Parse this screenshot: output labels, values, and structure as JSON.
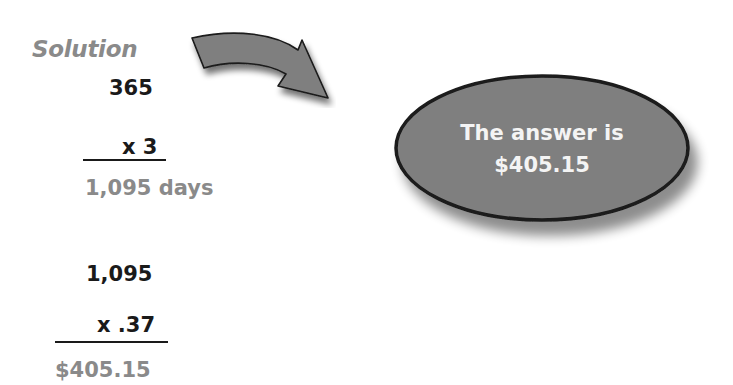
{
  "heading": "Solution",
  "step1": {
    "multiplicand": "365",
    "multiplier": "x 3",
    "result": "1,095 days"
  },
  "step2": {
    "multiplicand": "1,095",
    "multiplier": "x .37",
    "result": "$405.15"
  },
  "callout": {
    "line1": "The answer is",
    "line2": "$405.15"
  },
  "icons": {
    "arrow": "curved-arrow-right",
    "bubble": "oval-callout"
  },
  "colors": {
    "shape_fill": "#7f7f7f",
    "shape_stroke": "#1a1a1a",
    "label_grey": "#8a8a8a",
    "text_dark": "#1a1a1a",
    "callout_text": "#f4f4f4"
  }
}
